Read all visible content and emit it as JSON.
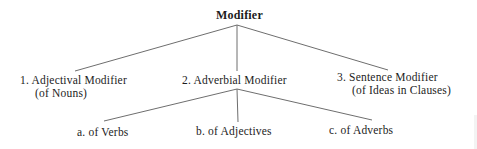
{
  "diagram": {
    "type": "tree",
    "root": {
      "label": "Modifier"
    },
    "level1": [
      {
        "number": "1.",
        "label": "Adjectival Modifier",
        "sublabel": "(of Nouns)"
      },
      {
        "number": "2.",
        "label": "Adverbial Modifier",
        "sublabel": ""
      },
      {
        "number": "3.",
        "label": "Sentence Modifier",
        "sublabel": "(of Ideas in Clauses)"
      }
    ],
    "level2": [
      {
        "letter": "a.",
        "label": "of Verbs"
      },
      {
        "letter": "b.",
        "label": "of Adjectives"
      },
      {
        "letter": "c.",
        "label": "of Adverbs"
      }
    ],
    "line_color": "#6e6e6e",
    "text_color": "#1c1c1c"
  }
}
